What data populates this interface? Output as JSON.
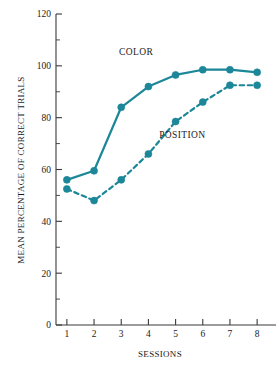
{
  "chart_data": {
    "type": "line",
    "title": "",
    "xlabel": "SESSIONS",
    "ylabel": "MEAN PERCENTAGE OF CORRECT TRIALS",
    "categories": [
      "1",
      "2",
      "3",
      "4",
      "5",
      "6",
      "7",
      "8"
    ],
    "x": [
      1,
      2,
      3,
      4,
      5,
      6,
      7,
      8
    ],
    "xlim": [
      0.6,
      8.4
    ],
    "ylim": [
      0,
      120
    ],
    "y_ticks_major": [
      0,
      20,
      40,
      60,
      80,
      100,
      120
    ],
    "y_ticks_minor": [
      10,
      30,
      50,
      70,
      90,
      110
    ],
    "x_ticks": [
      1,
      2,
      3,
      4,
      5,
      6,
      7,
      8
    ],
    "grid": false,
    "legend_position": "inline-annotations",
    "accent_color": "#1b8798",
    "axis_color": "#3a3a3a",
    "background_color": "#ffffff",
    "series": [
      {
        "name": "COLOR",
        "line_style": "solid",
        "color": "#1b8798",
        "marker": "circle",
        "values": [
          56,
          59.5,
          84,
          92,
          96.5,
          98.5,
          98.5,
          97.5
        ],
        "annotation": {
          "text": "COLOR",
          "x": 3.55,
          "y": 104
        }
      },
      {
        "name": "POSITION",
        "line_style": "dashed",
        "color": "#1b8798",
        "marker": "circle",
        "values": [
          52.5,
          48,
          56,
          66,
          78.5,
          86,
          92.5,
          92.5
        ],
        "annotation": {
          "text": "POSITION",
          "x": 5.25,
          "y": 72
        }
      }
    ],
    "y_tick_labels": [
      "0",
      "20",
      "40",
      "60",
      "80",
      "100",
      "120"
    ],
    "x_tick_labels": [
      "1",
      "2",
      "3",
      "4",
      "5",
      "6",
      "7",
      "8"
    ]
  }
}
